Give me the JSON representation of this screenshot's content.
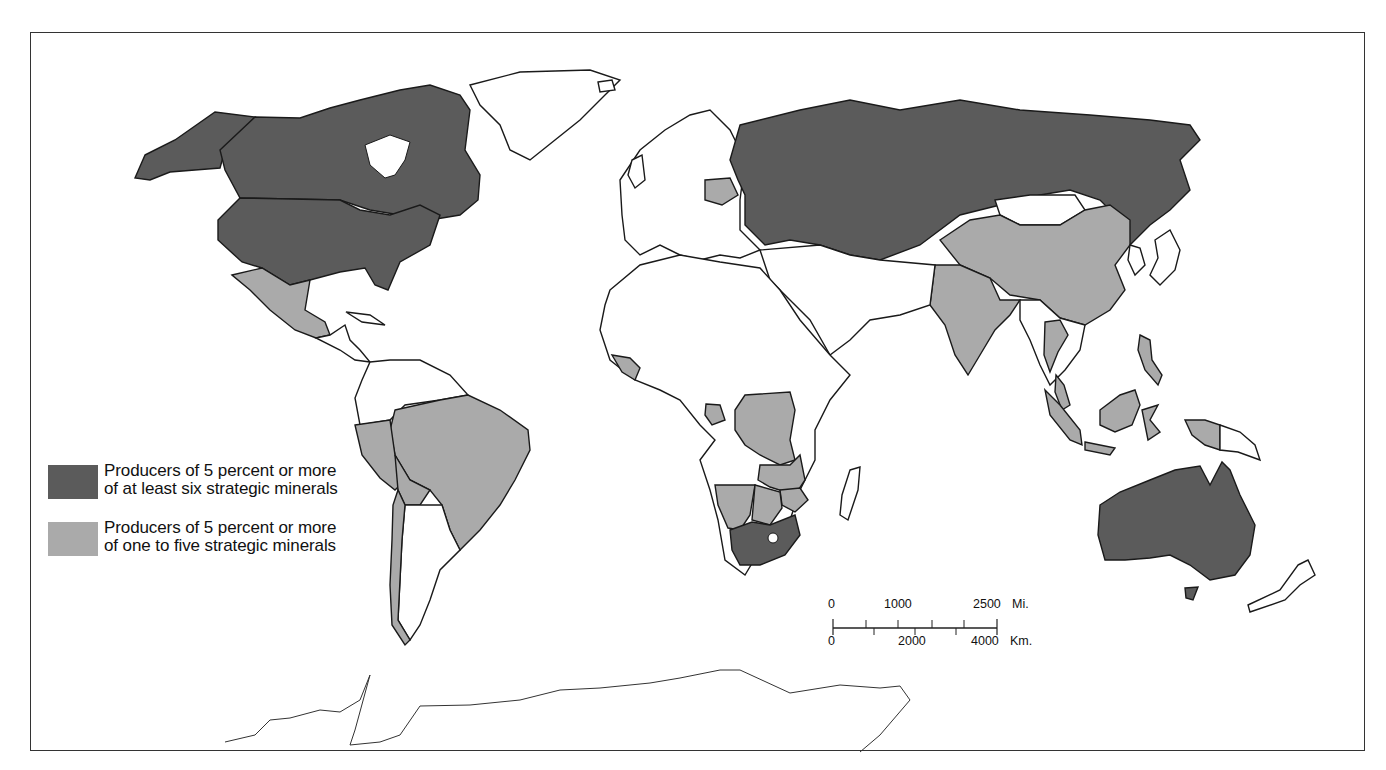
{
  "map": {
    "type": "world choropleth",
    "theme": "Major producers of strategic minerals",
    "colors": {
      "dark": "#5b5b5b",
      "light": "#aaaaaa",
      "none": "#ffffff",
      "outline": "#1a1a1a"
    }
  },
  "legend": {
    "items": [
      {
        "key": "dark",
        "line1": "Producers of 5 percent or more",
        "line2": "of at least six strategic minerals"
      },
      {
        "key": "light",
        "line1": "Producers of 5 percent or more",
        "line2": "of one to five strategic minerals"
      }
    ]
  },
  "scale_bar": {
    "miles": {
      "labels": [
        "0",
        "1000",
        "2500"
      ],
      "unit": "Mi."
    },
    "kilometers": {
      "labels": [
        "0",
        "2000",
        "4000"
      ],
      "unit": "Km."
    }
  },
  "regions": {
    "dark": [
      "Canada",
      "United States",
      "Soviet Union",
      "South Africa",
      "Australia"
    ],
    "light": [
      "Mexico",
      "Brazil",
      "Peru",
      "Bolivia",
      "Chile",
      "China",
      "India",
      "Thailand",
      "Malaysia",
      "Indonesia",
      "Philippines",
      "Zaire",
      "Zambia",
      "Zimbabwe",
      "Namibia",
      "Botswana",
      "Guinea",
      "Gabon",
      "Poland",
      "Turkey"
    ]
  }
}
